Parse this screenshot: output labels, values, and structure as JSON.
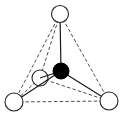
{
  "diagram": {
    "type": "tetrahedral-molecule",
    "colors": {
      "background": "#ffffff",
      "outer_atom_fill": "#ffffff",
      "central_atom_fill": "#000000",
      "line": "#1a1a1a"
    },
    "atoms": [
      {
        "id": "top",
        "kind": "outer",
        "cx": 60,
        "cy": 14,
        "r": 8.5
      },
      {
        "id": "back",
        "kind": "outer",
        "cx": 40,
        "cy": 78,
        "r": 8
      },
      {
        "id": "bottom-left",
        "kind": "outer",
        "cx": 14,
        "cy": 102,
        "r": 9
      },
      {
        "id": "bottom-right",
        "kind": "outer",
        "cx": 109,
        "cy": 101,
        "r": 9
      },
      {
        "id": "center",
        "kind": "central",
        "cx": 61,
        "cy": 71,
        "r": 8
      }
    ],
    "solid_bonds": [
      {
        "from": "center",
        "to": "top"
      },
      {
        "from": "center",
        "to": "back"
      },
      {
        "from": "center",
        "to": "bottom-left"
      },
      {
        "from": "center",
        "to": "bottom-right"
      }
    ],
    "dashed_edges": [
      {
        "from": "top",
        "to": "bottom-left"
      },
      {
        "from": "top",
        "to": "back"
      },
      {
        "from": "top",
        "to": "bottom-right"
      },
      {
        "from": "back",
        "to": "bottom-left"
      },
      {
        "from": "back",
        "to": "bottom-right"
      },
      {
        "from": "bottom-left",
        "to": "bottom-right"
      }
    ]
  }
}
